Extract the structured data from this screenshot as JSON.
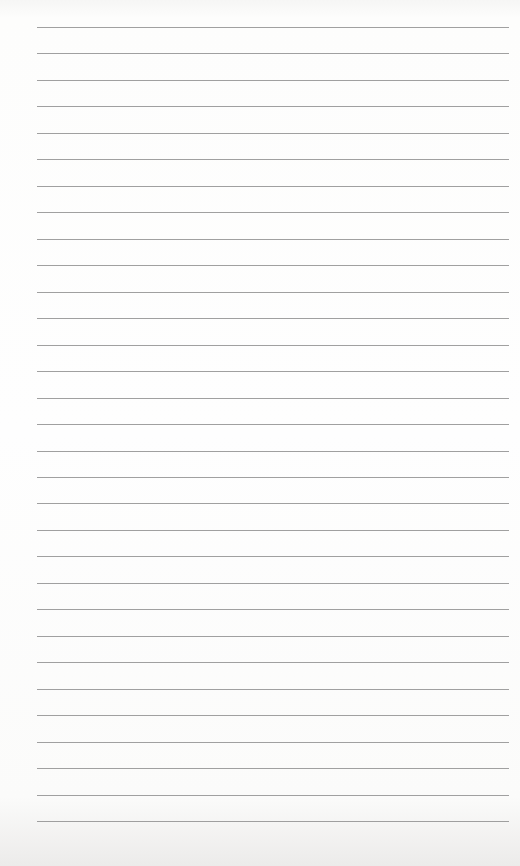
{
  "paper": {
    "type": "lined-sheet",
    "line_count": 31,
    "first_line_y": 27,
    "line_spacing": 26.47,
    "line_left": 37,
    "line_right": 509,
    "line_color": "#8f8f8f",
    "background_color": "#fbfbfa"
  }
}
